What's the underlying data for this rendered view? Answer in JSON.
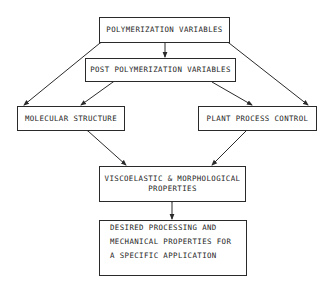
{
  "diagram": {
    "nodes": {
      "polymerization_variables": {
        "label": "POLYMERIZATION VARIABLES"
      },
      "post_polymerization_variables": {
        "label": "POST POLYMERIZATION VARIABLES"
      },
      "molecular_structure": {
        "label": "MOLECULAR STRUCTURE"
      },
      "plant_process_control": {
        "label": "PLANT PROCESS CONTROL"
      },
      "viscoelastic_properties": {
        "line1": "VISCOELASTIC & MORPHOLOGICAL",
        "line2": "PROPERTIES"
      },
      "desired_properties": {
        "line1": "DESIRED PROCESSING AND",
        "line2": "MECHANICAL PROPERTIES FOR",
        "line3": "A SPECIFIC APPLICATION"
      }
    },
    "edges": [
      {
        "from": "polymerization_variables",
        "to": "post_polymerization_variables",
        "type": "one-way"
      },
      {
        "from": "polymerization_variables",
        "to": "molecular_structure",
        "type": "two-way"
      },
      {
        "from": "polymerization_variables",
        "to": "plant_process_control",
        "type": "two-way"
      },
      {
        "from": "post_polymerization_variables",
        "to": "molecular_structure",
        "type": "two-way"
      },
      {
        "from": "post_polymerization_variables",
        "to": "plant_process_control",
        "type": "one-way"
      },
      {
        "from": "molecular_structure",
        "to": "viscoelastic_properties",
        "type": "two-way"
      },
      {
        "from": "plant_process_control",
        "to": "viscoelastic_properties",
        "type": "one-way"
      },
      {
        "from": "viscoelastic_properties",
        "to": "desired_properties",
        "type": "two-way"
      }
    ],
    "colors": {
      "line": "#2a2a2a",
      "text": "#1e1e1e",
      "background": "#ffffff"
    }
  }
}
